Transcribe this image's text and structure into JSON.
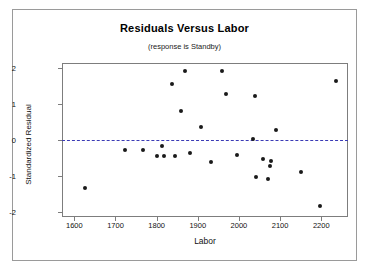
{
  "chart_data": {
    "type": "scatter",
    "title": "Residuals Versus Labor",
    "subtitle": "(response is Standby)",
    "xlabel": "Labor",
    "ylabel": "Standardized Residual",
    "xlim": [
      1570,
      2265
    ],
    "ylim": [
      -2.15,
      2.15
    ],
    "xticks": [
      1600,
      1700,
      1800,
      1900,
      2000,
      2100,
      2200
    ],
    "yticks": [
      2,
      1,
      0,
      -1,
      -2
    ],
    "xtick_labels": [
      "1600",
      "1700",
      "1800",
      "1900",
      "2000",
      "2100",
      "2200"
    ],
    "ytick_labels": [
      "2",
      "1",
      "0",
      "-1",
      "-2"
    ],
    "grid": false,
    "legend": false,
    "reference_line": {
      "y": 0,
      "style": "dashed",
      "color": "#3b3bb5"
    },
    "marker_color": "#1a1a1a",
    "points": [
      {
        "x": 1626,
        "y": -1.35
      },
      {
        "x": 1723,
        "y": -0.28
      },
      {
        "x": 1768,
        "y": -0.28
      },
      {
        "x": 1800,
        "y": -0.45
      },
      {
        "x": 1812,
        "y": -0.18
      },
      {
        "x": 1818,
        "y": -0.45
      },
      {
        "x": 1845,
        "y": -0.45
      },
      {
        "x": 1838,
        "y": 1.55
      },
      {
        "x": 1869,
        "y": 1.92
      },
      {
        "x": 1860,
        "y": 0.82
      },
      {
        "x": 1882,
        "y": -0.35
      },
      {
        "x": 1908,
        "y": 0.37
      },
      {
        "x": 1932,
        "y": -0.62
      },
      {
        "x": 1958,
        "y": 1.92
      },
      {
        "x": 1968,
        "y": 1.28
      },
      {
        "x": 1996,
        "y": -0.42
      },
      {
        "x": 2035,
        "y": 0.02
      },
      {
        "x": 2040,
        "y": 1.22
      },
      {
        "x": 2042,
        "y": -1.02
      },
      {
        "x": 2058,
        "y": -0.52
      },
      {
        "x": 2070,
        "y": -1.08
      },
      {
        "x": 2078,
        "y": -0.6
      },
      {
        "x": 2076,
        "y": -0.72
      },
      {
        "x": 2090,
        "y": 0.28
      },
      {
        "x": 2150,
        "y": -0.88
      },
      {
        "x": 2198,
        "y": -1.85
      },
      {
        "x": 2235,
        "y": 1.65
      }
    ]
  }
}
